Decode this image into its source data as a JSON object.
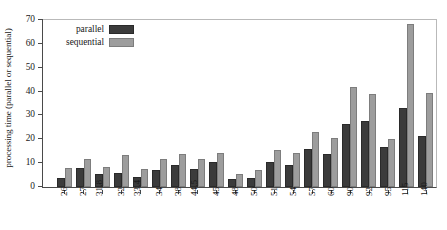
{
  "chart_data": {
    "type": "bar",
    "title": "",
    "xlabel": "",
    "ylabel": "processing time (parallel or sequential)",
    "ylim": [
      0,
      70
    ],
    "yticks": [
      0,
      10,
      20,
      30,
      40,
      50,
      60,
      70
    ],
    "grid": false,
    "legend_position": "top-left",
    "categories": [
      "26",
      "27",
      "31.8",
      "32",
      "33.4",
      "34",
      "38",
      "44.5",
      "45",
      "48",
      "50",
      "51",
      "54",
      "57",
      "60",
      "90",
      "92",
      "95",
      "115",
      "140"
    ],
    "series": [
      {
        "name": "parallel",
        "color": "#3b3b3b",
        "values": [
          3.9,
          8.0,
          5.3,
          6.0,
          4.2,
          7.3,
          9.2,
          7.6,
          10.3,
          3.3,
          3.8,
          10.3,
          9.1,
          15.8,
          14.0,
          26.5,
          27.8,
          16.9,
          33.1,
          21.2
        ]
      },
      {
        "name": "sequential",
        "color": "#9d9d9d",
        "values": [
          8.0,
          11.7,
          8.2,
          13.3,
          7.5,
          11.9,
          13.8,
          11.9,
          14.2,
          5.6,
          7.1,
          15.4,
          14.1,
          23.2,
          20.5,
          41.8,
          38.9,
          20.0,
          68.2,
          39.6
        ]
      }
    ]
  },
  "legend": {
    "items": [
      {
        "label": "parallel"
      },
      {
        "label": "sequential"
      }
    ]
  },
  "colors": {
    "parallel": "#3b3b3b",
    "sequential": "#9d9d9d",
    "axis": "#4a4a4a",
    "background": "#ffffff"
  }
}
